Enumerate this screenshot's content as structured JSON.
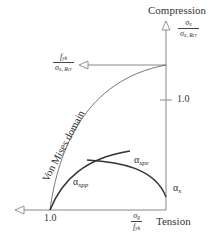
{
  "diagram": {
    "type": "interaction-domain",
    "colors": {
      "axis": "#888888",
      "curve": "#333333",
      "thin_curve": "#555555",
      "text": "#333333"
    },
    "vertical_axis": {
      "label": "Compression",
      "fraction": {
        "numerator": "σ",
        "numerator_sub": "x",
        "denominator": "σ",
        "denominator_sub": "x, Rcr"
      },
      "tick_label": "1.0"
    },
    "horizontal_axis": {
      "label": "Tension",
      "fraction": {
        "numerator": "σ",
        "numerator_sub": "g",
        "denominator": "f",
        "denominator_sub": "yk"
      },
      "tick_label": "1.0"
    },
    "yield_line": {
      "fraction": {
        "numerator": "f",
        "numerator_sub": "yk",
        "denominator": "σ",
        "denominator_sub": "x, Rcr"
      }
    },
    "domain_label": "Von Mises domain",
    "curves": [
      {
        "name": "alpha-xpp",
        "symbol": "α",
        "sub": "xpp"
      },
      {
        "name": "alpha-xpe",
        "symbol": "α",
        "sub": "xpe"
      },
      {
        "name": "alpha-x",
        "symbol": "α",
        "sub": "x"
      }
    ]
  }
}
